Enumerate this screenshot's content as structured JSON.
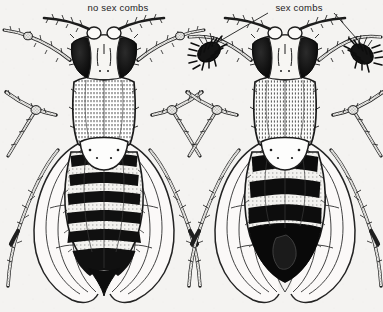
{
  "figure": {
    "background_color": "#f4f3f1",
    "ink_color": "#1c1c1c",
    "width": 383,
    "height": 312
  },
  "labels": {
    "left": {
      "text": "no sex combs",
      "x": 118,
      "y": 11,
      "anchor": "middle",
      "has_leader_lines": false
    },
    "right": {
      "text": "sex combs",
      "x": 299,
      "y": 11,
      "anchor": "middle",
      "has_leader_lines": true,
      "leader_lines": [
        {
          "name": "leader-line-left",
          "x1": 268,
          "y1": 13,
          "x2": 213,
          "y2": 45
        },
        {
          "name": "leader-line-right",
          "x1": 334,
          "y1": 13,
          "x2": 364,
          "y2": 47
        }
      ]
    }
  },
  "specimens": [
    {
      "id": "female-fly",
      "sex": "female",
      "label_ref": "no sex combs",
      "center_x": 104,
      "abdomen": {
        "stripe_count": 6,
        "tip_shape": "pointed",
        "tip_solid_black": false
      },
      "forelegs_have_sex_combs": false,
      "parts": [
        "antenna-left",
        "antenna-right",
        "eye-left",
        "eye-right",
        "face",
        "thorax",
        "scutellum",
        "wing-left",
        "wing-right",
        "abdomen",
        "foreleg-left",
        "foreleg-right",
        "midleg-left",
        "midleg-right",
        "hindleg-left",
        "hindleg-right"
      ]
    },
    {
      "id": "male-fly",
      "sex": "male",
      "label_ref": "sex combs",
      "center_x": 285,
      "abdomen": {
        "stripe_count": 4,
        "tip_shape": "rounded",
        "tip_solid_black": true
      },
      "forelegs_have_sex_combs": true,
      "sex_comb_positions": [
        {
          "name": "sex-comb-left",
          "x": 209,
          "y": 52
        },
        {
          "name": "sex-comb-right",
          "x": 362,
          "y": 54
        }
      ],
      "parts": [
        "antenna-left",
        "antenna-right",
        "eye-left",
        "eye-right",
        "face",
        "thorax",
        "scutellum",
        "wing-left",
        "wing-right",
        "abdomen",
        "foreleg-left",
        "foreleg-right",
        "midleg-left",
        "midleg-right",
        "hindleg-left",
        "hindleg-right",
        "sex-comb-left",
        "sex-comb-right"
      ]
    }
  ]
}
